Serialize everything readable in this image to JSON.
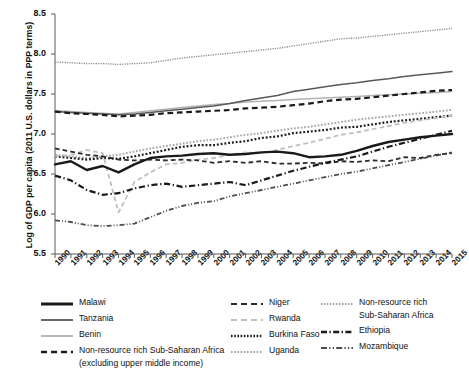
{
  "chart_data": {
    "type": "line",
    "title": "",
    "xlabel": "",
    "ylabel": "Log of GDP per capita (2011 U.S. dollars in PPP terms)",
    "ylim": [
      5.5,
      8.5
    ],
    "yticks": [
      "5.5",
      "6.0",
      "6.5",
      "7.0",
      "7.5",
      "8.0",
      "8.5"
    ],
    "grid": false,
    "legend_position": "bottom",
    "x": [
      1990,
      1991,
      1992,
      1993,
      1994,
      1995,
      1996,
      1997,
      1998,
      1999,
      2000,
      2001,
      2002,
      2003,
      2004,
      2005,
      2006,
      2007,
      2008,
      2009,
      2010,
      2011,
      2012,
      2013,
      2014,
      2015
    ],
    "categories": [
      "1990",
      "1991",
      "1992",
      "1993",
      "1994",
      "1995",
      "1996",
      "1997",
      "1998",
      "1999",
      "2000",
      "2001",
      "2002",
      "2003",
      "2004",
      "2005",
      "2006",
      "2007",
      "2008",
      "2009",
      "2010",
      "2011",
      "2012",
      "2013",
      "2014",
      "2015"
    ],
    "series": [
      {
        "name": "Malawi",
        "style": "solid",
        "color": "#1a1a1a",
        "width": 2.4,
        "values": [
          6.62,
          6.66,
          6.55,
          6.6,
          6.52,
          6.62,
          6.7,
          6.72,
          6.73,
          6.75,
          6.76,
          6.74,
          6.75,
          6.77,
          6.78,
          6.76,
          6.71,
          6.72,
          6.74,
          6.79,
          6.85,
          6.9,
          6.93,
          6.96,
          6.98,
          7.0
        ]
      },
      {
        "name": "Tanzania",
        "style": "solid",
        "color": "#595959",
        "width": 1.5,
        "values": [
          7.28,
          7.27,
          7.26,
          7.25,
          7.24,
          7.25,
          7.27,
          7.29,
          7.31,
          7.33,
          7.35,
          7.38,
          7.42,
          7.45,
          7.48,
          7.53,
          7.56,
          7.59,
          7.62,
          7.64,
          7.67,
          7.69,
          7.72,
          7.74,
          7.76,
          7.78
        ]
      },
      {
        "name": "Benin",
        "style": "solid",
        "color": "#b3b3b3",
        "width": 1.5,
        "values": [
          7.29,
          7.28,
          7.27,
          7.26,
          7.25,
          7.27,
          7.29,
          7.31,
          7.33,
          7.35,
          7.37,
          7.38,
          7.4,
          7.41,
          7.42,
          7.43,
          7.44,
          7.45,
          7.46,
          7.47,
          7.48,
          7.49,
          7.5,
          7.51,
          7.52,
          7.53
        ]
      },
      {
        "name": "Non-resource rich Sub-Saharan Africa (excluding upper middle income)",
        "style": "dashed",
        "color": "#1a1a1a",
        "width": 2.2,
        "values": [
          7.28,
          7.26,
          7.25,
          7.24,
          7.22,
          7.23,
          7.24,
          7.26,
          7.27,
          7.28,
          7.29,
          7.3,
          7.32,
          7.33,
          7.34,
          7.36,
          7.38,
          7.41,
          7.43,
          7.44,
          7.46,
          7.48,
          7.5,
          7.52,
          7.54,
          7.55
        ]
      },
      {
        "name": "Niger",
        "style": "dashed",
        "color": "#2b2b2b",
        "width": 1.8,
        "values": [
          6.82,
          6.78,
          6.74,
          6.72,
          6.68,
          6.67,
          6.68,
          6.67,
          6.68,
          6.67,
          6.64,
          6.66,
          6.64,
          6.66,
          6.63,
          6.63,
          6.64,
          6.63,
          6.66,
          6.65,
          6.67,
          6.66,
          6.71,
          6.7,
          6.74,
          6.76
        ]
      },
      {
        "name": "Rwanda",
        "style": "dashed",
        "color": "#bfbfbf",
        "width": 1.8,
        "values": [
          6.72,
          6.74,
          6.8,
          6.76,
          6.02,
          6.4,
          6.52,
          6.62,
          6.64,
          6.68,
          6.7,
          6.74,
          6.77,
          6.76,
          6.8,
          6.85,
          6.89,
          6.94,
          6.99,
          7.02,
          7.06,
          7.1,
          7.14,
          7.17,
          7.2,
          7.23
        ]
      },
      {
        "name": "Burkina Faso",
        "style": "dotted",
        "color": "#1a1a1a",
        "width": 2.2,
        "values": [
          6.72,
          6.7,
          6.68,
          6.7,
          6.69,
          6.72,
          6.76,
          6.8,
          6.84,
          6.86,
          6.86,
          6.89,
          6.91,
          6.95,
          6.97,
          7.01,
          7.03,
          7.05,
          7.08,
          7.09,
          7.12,
          7.15,
          7.17,
          7.19,
          7.21,
          7.23
        ]
      },
      {
        "name": "Uganda",
        "style": "dotted",
        "color": "#a6a6a6",
        "width": 2.0,
        "values": [
          6.74,
          6.72,
          6.7,
          6.72,
          6.74,
          6.78,
          6.82,
          6.85,
          6.88,
          6.91,
          6.93,
          6.96,
          6.99,
          7.01,
          7.04,
          7.07,
          7.09,
          7.12,
          7.15,
          7.18,
          7.2,
          7.22,
          7.24,
          7.26,
          7.28,
          7.3
        ]
      },
      {
        "name": "Non-resource rich Sub-Saharan Africa",
        "style": "dotted",
        "color": "#8c8c8c",
        "width": 1.4,
        "values": [
          7.9,
          7.89,
          7.88,
          7.88,
          7.87,
          7.88,
          7.89,
          7.92,
          7.95,
          7.97,
          7.99,
          8.01,
          8.03,
          8.05,
          8.07,
          8.1,
          8.13,
          8.16,
          8.19,
          8.2,
          8.22,
          8.24,
          8.26,
          8.28,
          8.3,
          8.32
        ]
      },
      {
        "name": "Ethiopia",
        "style": "dashdot",
        "color": "#1a1a1a",
        "width": 2.2,
        "values": [
          6.48,
          6.42,
          6.3,
          6.24,
          6.26,
          6.32,
          6.36,
          6.38,
          6.34,
          6.36,
          6.38,
          6.4,
          6.36,
          6.42,
          6.48,
          6.54,
          6.59,
          6.64,
          6.68,
          6.72,
          6.78,
          6.84,
          6.89,
          6.94,
          6.99,
          7.04
        ]
      },
      {
        "name": "Mozambique",
        "style": "dashdotdot",
        "color": "#4d4d4d",
        "width": 1.8,
        "values": [
          5.92,
          5.9,
          5.86,
          5.85,
          5.86,
          5.88,
          5.96,
          6.04,
          6.1,
          6.14,
          6.16,
          6.22,
          6.26,
          6.3,
          6.34,
          6.38,
          6.42,
          6.46,
          6.5,
          6.53,
          6.57,
          6.61,
          6.65,
          6.69,
          6.73,
          6.77
        ]
      }
    ]
  },
  "legend": {
    "columns": [
      {
        "items": [
          {
            "label": "Malawi",
            "key": "solid-thick-black"
          },
          {
            "label": "Tanzania",
            "key": "solid-gray"
          },
          {
            "label": "Benin",
            "key": "solid-light-gray"
          },
          {
            "label": "Non-resource rich Sub-Saharan Africa",
            "key": "dashed-black",
            "sub": "(excluding upper middle income)"
          }
        ]
      },
      {
        "items": [
          {
            "label": "Niger",
            "key": "dashed-dark"
          },
          {
            "label": "Rwanda",
            "key": "dashed-light-gray"
          },
          {
            "label": "Burkina Faso",
            "key": "dotted-black"
          },
          {
            "label": "Uganda",
            "key": "dotted-gray"
          }
        ]
      },
      {
        "items": [
          {
            "label": "Non-resource rich",
            "key": "dotted-light-gray",
            "sub": "Sub-Saharan Africa"
          },
          {
            "label": "Ethiopia",
            "key": "dashdot-black"
          },
          {
            "label": "Mozambique",
            "key": "dashdotdot-gray"
          }
        ]
      }
    ]
  }
}
